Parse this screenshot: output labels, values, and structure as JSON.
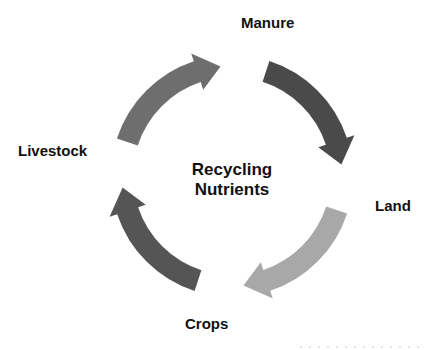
{
  "diagram": {
    "type": "cycle",
    "center_title": [
      "Recycling",
      "Nutrients"
    ],
    "nodes": [
      {
        "id": "manure",
        "label": "Manure"
      },
      {
        "id": "land",
        "label": "Land"
      },
      {
        "id": "crops",
        "label": "Crops"
      },
      {
        "id": "livestock",
        "label": "Livestock"
      }
    ],
    "edges": [
      {
        "from": "livestock",
        "to": "manure",
        "color": "#6e6e6e"
      },
      {
        "from": "manure",
        "to": "land",
        "color": "#4a4a4a"
      },
      {
        "from": "land",
        "to": "crops",
        "color": "#a8a8a8"
      },
      {
        "from": "crops",
        "to": "livestock",
        "color": "#555555"
      }
    ]
  }
}
